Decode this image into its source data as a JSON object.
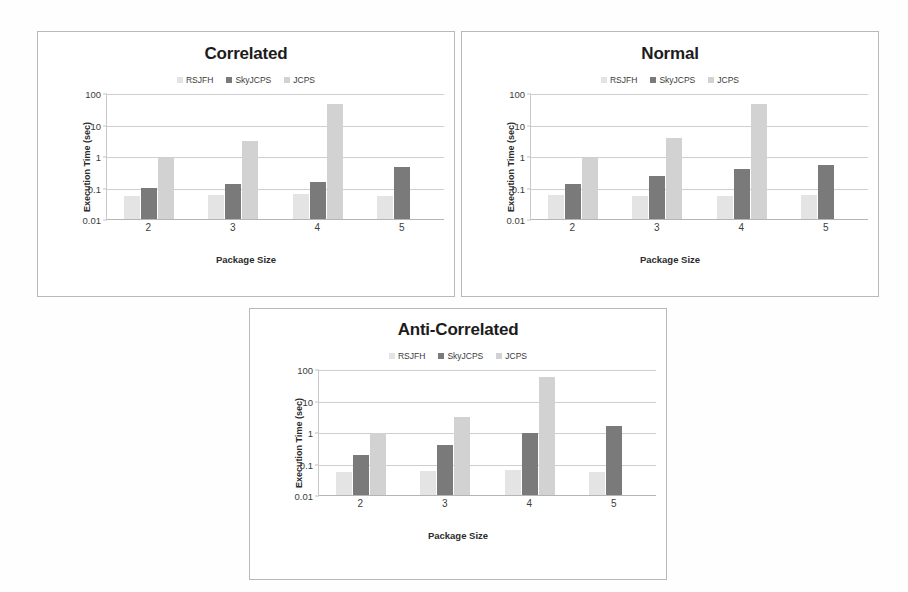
{
  "figure": {
    "background": "#fefefe",
    "panel_border": "#b9b9b9"
  },
  "series_colors": {
    "RSJFH": "#e4e4e4",
    "SkyJCPS": "#7a7a7a",
    "JCPS": "#d2d2d2"
  },
  "legend": {
    "entries": [
      {
        "label": "RSJFH",
        "color": "#e4e4e4"
      },
      {
        "label": "SkyJCPS",
        "color": "#7a7a7a"
      },
      {
        "label": "JCPS",
        "color": "#d2d2d2"
      }
    ]
  },
  "axis": {
    "ylabel": "Execution Time (sec)",
    "xlabel": "Package Size",
    "yticks": [
      "100",
      "10",
      "1",
      "0.1",
      "0.01"
    ],
    "xticks": [
      "2",
      "3",
      "4",
      "5"
    ],
    "ylim": [
      0.01,
      100
    ],
    "yscale": "log"
  },
  "chart_data": [
    {
      "type": "bar",
      "title": "Correlated",
      "xlabel": "Package Size",
      "ylabel": "Execution Time (sec)",
      "yscale": "log",
      "ylim": [
        0.01,
        100
      ],
      "yticks": [
        0.01,
        0.1,
        1,
        10,
        100
      ],
      "grid": true,
      "legend_position": "top",
      "categories": [
        "2",
        "3",
        "4",
        "5"
      ],
      "series": [
        {
          "name": "RSJFH",
          "color": "#e4e4e4",
          "values": [
            0.055,
            0.06,
            0.062,
            0.055
          ]
        },
        {
          "name": "SkyJCPS",
          "color": "#7a7a7a",
          "values": [
            0.1,
            0.125,
            0.145,
            0.46
          ]
        },
        {
          "name": "JCPS",
          "color": "#d2d2d2",
          "values": [
            0.88,
            2.9,
            45,
            null
          ]
        }
      ]
    },
    {
      "type": "bar",
      "title": "Normal",
      "xlabel": "Package Size",
      "ylabel": "Execution Time (sec)",
      "yscale": "log",
      "ylim": [
        0.01,
        100
      ],
      "yticks": [
        0.01,
        0.1,
        1,
        10,
        100
      ],
      "grid": true,
      "legend_position": "top",
      "categories": [
        "2",
        "3",
        "4",
        "5"
      ],
      "series": [
        {
          "name": "RSJFH",
          "color": "#e4e4e4",
          "values": [
            0.06,
            0.052,
            0.053,
            0.056
          ]
        },
        {
          "name": "SkyJCPS",
          "color": "#7a7a7a",
          "values": [
            0.13,
            0.23,
            0.38,
            0.53
          ]
        },
        {
          "name": "JCPS",
          "color": "#d2d2d2",
          "values": [
            0.87,
            3.8,
            46,
            null
          ]
        }
      ]
    },
    {
      "type": "bar",
      "title": "Anti-Correlated",
      "xlabel": "Package Size",
      "ylabel": "Execution Time (sec)",
      "yscale": "log",
      "ylim": [
        0.01,
        100
      ],
      "yticks": [
        0.01,
        0.1,
        1,
        10,
        100
      ],
      "grid": true,
      "legend_position": "top",
      "categories": [
        "2",
        "3",
        "4",
        "5"
      ],
      "series": [
        {
          "name": "RSJFH",
          "color": "#e4e4e4",
          "values": [
            0.055,
            0.06,
            0.063,
            0.055
          ]
        },
        {
          "name": "SkyJCPS",
          "color": "#7a7a7a",
          "values": [
            0.18,
            0.38,
            0.9,
            1.5
          ]
        },
        {
          "name": "JCPS",
          "color": "#d2d2d2",
          "values": [
            0.95,
            3.0,
            55,
            null
          ]
        }
      ]
    }
  ]
}
